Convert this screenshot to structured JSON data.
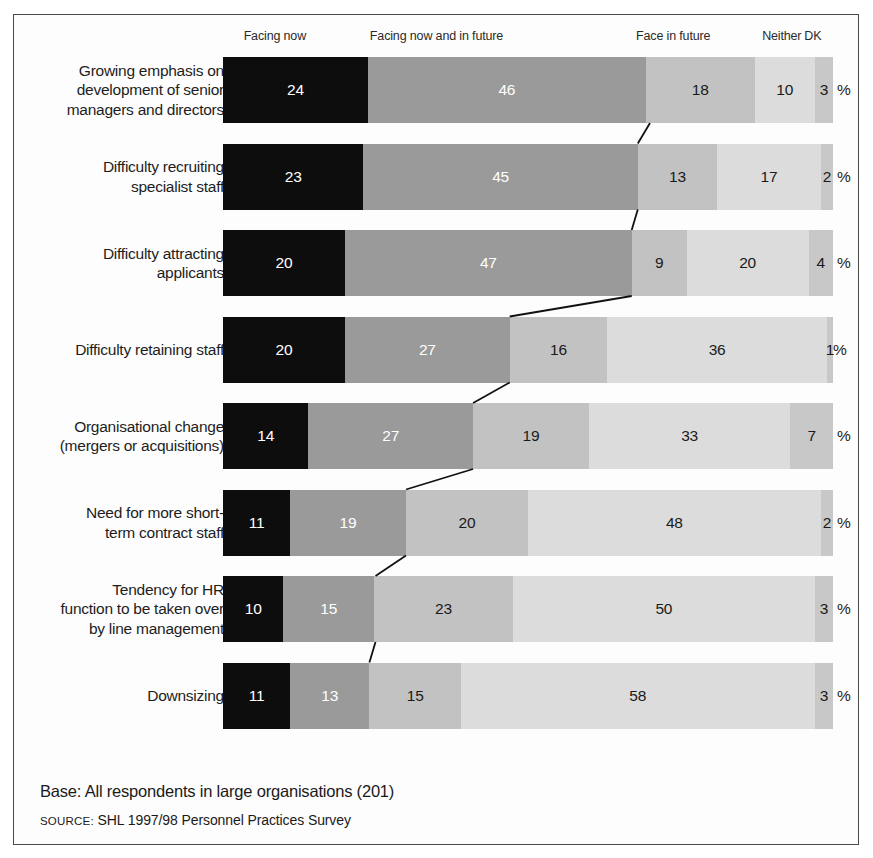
{
  "chart_data": {
    "type": "bar",
    "subtype": "stacked-horizontal-100pct",
    "title": "",
    "xlabel": "",
    "ylabel": "",
    "xlim": [
      0,
      100
    ],
    "grid": false,
    "legend_position": "top",
    "value_suffix": "%",
    "legend": [
      {
        "label": "Facing now",
        "color": "#0d0d0d",
        "center_pct": 8.5
      },
      {
        "label": "Facing now and in future",
        "color": "#9a9a9a",
        "center_pct": 35.0
      },
      {
        "label": "Face in future",
        "color": "#c2c2c2",
        "center_pct": 73.8
      },
      {
        "label": "Neither",
        "color": "#dcdcdc",
        "center_pct": 91.6
      },
      {
        "label": "DK",
        "color": "#c8c8c8",
        "center_pct": 96.7
      }
    ],
    "categories": [
      "Growing emphasis on development of senior managers and directors",
      "Difficulty recruiting specialist staff",
      "Difficulty attracting applicants",
      "Difficulty retaining staff",
      "Organisational change (mergers or acquisitions)",
      "Need for more short-term contract staff",
      "Tendency for HR function to be taken over by line management",
      "Downsizing"
    ],
    "series": [
      {
        "name": "Facing now",
        "values": [
          24,
          23,
          20,
          20,
          14,
          11,
          10,
          11
        ]
      },
      {
        "name": "Facing now and in future",
        "values": [
          46,
          45,
          47,
          27,
          27,
          19,
          15,
          13
        ]
      },
      {
        "name": "Face in future",
        "values": [
          18,
          13,
          9,
          16,
          19,
          20,
          23,
          15
        ]
      },
      {
        "name": "Neither",
        "values": [
          10,
          17,
          20,
          36,
          33,
          48,
          50,
          58
        ]
      },
      {
        "name": "DK",
        "values": [
          3,
          2,
          4,
          1,
          7,
          2,
          3,
          3
        ]
      }
    ]
  },
  "rows": [
    {
      "label_lines": [
        "Growing emphasis on",
        "development of senior",
        "managers and directors"
      ],
      "values": [
        24,
        46,
        18,
        10,
        3
      ],
      "pct_tight": false
    },
    {
      "label_lines": [
        "Difficulty recruiting",
        "specialist staff"
      ],
      "values": [
        23,
        45,
        13,
        17,
        2
      ],
      "pct_tight": false
    },
    {
      "label_lines": [
        "Difficulty attracting",
        "applicants"
      ],
      "values": [
        20,
        47,
        9,
        20,
        4
      ],
      "pct_tight": false
    },
    {
      "label_lines": [
        "Difficulty retaining staff"
      ],
      "values": [
        20,
        27,
        16,
        36,
        1
      ],
      "pct_tight": true
    },
    {
      "label_lines": [
        "Organisational change",
        "(mergers or acquisitions)"
      ],
      "values": [
        14,
        27,
        19,
        33,
        7
      ],
      "pct_tight": false
    },
    {
      "label_lines": [
        "Need for more short-",
        "term contract staff"
      ],
      "values": [
        11,
        19,
        20,
        48,
        2
      ],
      "pct_tight": false
    },
    {
      "label_lines": [
        "Tendency for HR",
        "function to be taken over",
        "by line management"
      ],
      "values": [
        10,
        15,
        23,
        50,
        3
      ],
      "pct_tight": false
    },
    {
      "label_lines": [
        "Downsizing"
      ],
      "values": [
        11,
        13,
        15,
        58,
        3
      ],
      "pct_tight": false
    }
  ],
  "footer": {
    "base_note": "Base: All respondents in large organisations (201)",
    "source_label": "SOURCE:",
    "source_text": "SHL 1997/98 Personnel Practices Survey"
  },
  "style": {
    "segment_colors": [
      "#0d0d0d",
      "#9a9a9a",
      "#c2c2c2",
      "#dcdcdc",
      "#c8c8c8"
    ],
    "segment_text_colors": [
      "#ffffff",
      "#ffffff",
      "#1a1a1a",
      "#1a1a1a",
      "#1a1a1a"
    ],
    "frame_color": "#4a4a4a",
    "connector_color": "#111111",
    "background": "#ffffff"
  }
}
